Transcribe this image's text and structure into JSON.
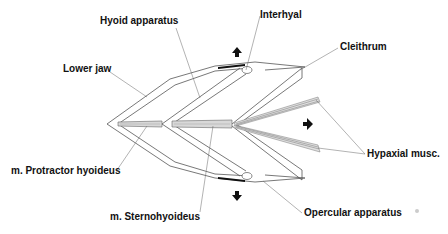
{
  "diagram": {
    "type": "anatomical-schematic",
    "labels": {
      "hyoid_apparatus": "Hyoid apparatus",
      "interhyal": "Interhyal",
      "cleithrum": "Cleithrum",
      "lower_jaw": "Lower jaw",
      "protractor_hyoideus": "m. Protractor hyoideus",
      "sternohyoideus": "m. Sternohyoideus",
      "hypaxial_musc": "Hypaxial musc.",
      "opercular_apparatus": "Opercular apparatus"
    },
    "arrows": [
      {
        "name": "dorsal-arrow",
        "direction": "up"
      },
      {
        "name": "caudal-arrow",
        "direction": "right"
      },
      {
        "name": "ventral-arrow",
        "direction": "down"
      }
    ],
    "colors": {
      "line": "#555555",
      "muscle_fill": "#d8d8d8",
      "bar_fill": "#111111",
      "text": "#111111"
    }
  }
}
